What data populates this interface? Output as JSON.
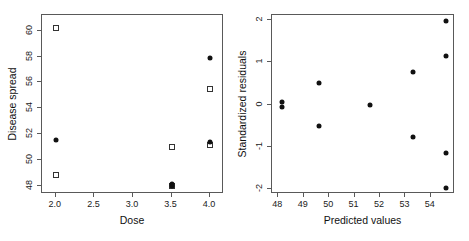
{
  "figure": {
    "background": "#ffffff",
    "frame_color": "#595959",
    "point_color": "#111111"
  },
  "chart_data": [
    {
      "type": "scatter",
      "panel": "left",
      "title": "",
      "xlabel": "Dose",
      "ylabel": "Disease spread",
      "xlim": [
        1.82,
        4.18
      ],
      "ylim": [
        47.4,
        61.2
      ],
      "xticks": [
        2.0,
        2.5,
        3.0,
        3.5,
        4.0
      ],
      "xticklabels": [
        "2.0",
        "2.5",
        "3.0",
        "3.5",
        "4.0"
      ],
      "yticks": [
        48,
        50,
        52,
        54,
        56,
        58,
        60
      ],
      "yticklabels": [
        "48",
        "50",
        "52",
        "54",
        "56",
        "58",
        "60"
      ],
      "grid": false,
      "legend": "none",
      "series": [
        {
          "name": "observed",
          "marker": "open-square",
          "points": [
            {
              "x": 2.0,
              "y": 60.2
            },
            {
              "x": 2.0,
              "y": 48.9
            },
            {
              "x": 3.5,
              "y": 51.0
            },
            {
              "x": 3.5,
              "y": 48.0
            },
            {
              "x": 4.0,
              "y": 55.5
            },
            {
              "x": 4.0,
              "y": 51.2
            }
          ]
        },
        {
          "name": "fitted",
          "marker": "filled-circle",
          "points": [
            {
              "x": 2.0,
              "y": 51.6
            },
            {
              "x": 3.5,
              "y": 48.2
            },
            {
              "x": 3.5,
              "y": 48.05
            },
            {
              "x": 4.0,
              "y": 57.9
            },
            {
              "x": 4.0,
              "y": 51.4
            }
          ]
        }
      ]
    },
    {
      "type": "scatter",
      "panel": "right",
      "title": "",
      "xlabel": "Predicted values",
      "ylabel": "Standardized residuals",
      "xlim": [
        47.75,
        54.95
      ],
      "ylim": [
        -2.12,
        2.12
      ],
      "xticks": [
        48,
        49,
        50,
        51,
        52,
        53,
        54
      ],
      "xticklabels": [
        "48",
        "49",
        "50",
        "51",
        "52",
        "53",
        "54"
      ],
      "yticks": [
        -2,
        -1,
        0,
        1,
        2
      ],
      "yticklabels": [
        "-2",
        "-1",
        "0",
        "1",
        "2"
      ],
      "grid": false,
      "legend": "none",
      "series": [
        {
          "name": "residuals",
          "marker": "filled-circle",
          "points": [
            {
              "x": 48.15,
              "y": 0.07
            },
            {
              "x": 48.15,
              "y": -0.07
            },
            {
              "x": 49.6,
              "y": 0.5
            },
            {
              "x": 49.6,
              "y": -0.5
            },
            {
              "x": 51.6,
              "y": 0.0
            },
            {
              "x": 53.3,
              "y": 0.77
            },
            {
              "x": 53.3,
              "y": -0.77
            },
            {
              "x": 54.6,
              "y": 1.97
            },
            {
              "x": 54.6,
              "y": 1.15
            },
            {
              "x": 54.6,
              "y": -1.15
            },
            {
              "x": 54.6,
              "y": -1.97
            }
          ]
        }
      ]
    }
  ]
}
